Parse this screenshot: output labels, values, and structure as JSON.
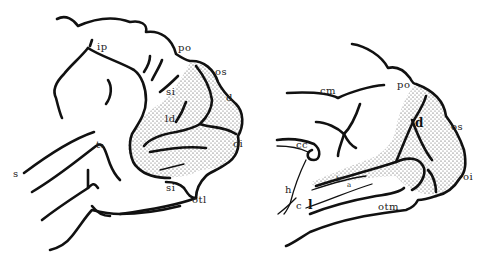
{
  "figure": {
    "background": "#ffffff",
    "ink": "#111111",
    "panels": [
      {
        "id": "lateral",
        "description": "Lateral view of brain hemisphere with stippled occipital region",
        "labels": [
          {
            "text": "ip",
            "x": 97,
            "y": 50
          },
          {
            "text": "po",
            "x": 178,
            "y": 51
          },
          {
            "text": "os",
            "x": 215,
            "y": 75
          },
          {
            "text": "si",
            "x": 166,
            "y": 95
          },
          {
            "text": "ld",
            "x": 165,
            "y": 122
          },
          {
            "text": "d",
            "x": 226,
            "y": 101
          },
          {
            "text": "oi",
            "x": 233,
            "y": 147
          },
          {
            "text": "t₁",
            "x": 96,
            "y": 148
          },
          {
            "text": "s",
            "x": 13,
            "y": 177
          },
          {
            "text": "si",
            "x": 166,
            "y": 191
          },
          {
            "text": "otl",
            "x": 192,
            "y": 203
          }
        ]
      },
      {
        "id": "medial",
        "description": "Medial view of brain hemisphere with stippled calcarine/occipital region",
        "labels": [
          {
            "text": "cm",
            "x": 320,
            "y": 94
          },
          {
            "text": "po",
            "x": 397,
            "y": 88
          },
          {
            "text": "d",
            "x": 415,
            "y": 127
          },
          {
            "text": "os",
            "x": 451,
            "y": 130
          },
          {
            "text": "cc",
            "x": 296,
            "y": 148
          },
          {
            "text": "oi",
            "x": 463,
            "y": 180
          },
          {
            "text": "h",
            "x": 285,
            "y": 193
          },
          {
            "text": "b",
            "x": 336,
            "y": 181
          },
          {
            "text": "a",
            "x": 347,
            "y": 187
          },
          {
            "text": "c",
            "x": 296,
            "y": 209
          },
          {
            "text": "l",
            "x": 308,
            "y": 209
          },
          {
            "text": "otm",
            "x": 378,
            "y": 210
          }
        ]
      }
    ]
  }
}
